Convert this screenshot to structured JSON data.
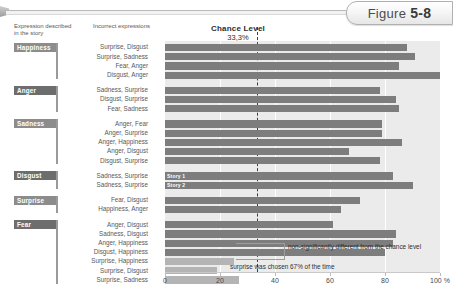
{
  "figure": {
    "label": "Figure",
    "number": "5",
    "dash": "-",
    "sub": "8"
  },
  "headers": {
    "expression_col": "Expression described in the story",
    "incorrect_col": "Incorrect expressions"
  },
  "annotations": {
    "non_significant": "non-significantly different from the chance level",
    "surprise_note": "surprise was chosen 67% of the time",
    "bar_label_story1": "Story 1",
    "bar_label_story2": "Story 2"
  },
  "chart_data": {
    "type": "bar",
    "title": "Chance Level",
    "subtitle": "33,3%",
    "xlabel": "",
    "ylabel": "",
    "xlim": [
      0,
      100
    ],
    "xticks": [
      0,
      20,
      40,
      60,
      80,
      100
    ],
    "xticklabels": [
      "0",
      "20",
      "40",
      "60",
      "80",
      "100 %"
    ],
    "unit": "%",
    "grid": true,
    "orientation": "horizontal",
    "chance_level": 33.3,
    "groups": [
      {
        "category": "Happiness",
        "bars": [
          {
            "label": "Surprise, Disgust",
            "value": 88,
            "shade": "dark"
          },
          {
            "label": "Surprise, Sadness",
            "value": 91,
            "shade": "dark"
          },
          {
            "label": "Fear, Anger",
            "value": 85,
            "shade": "dark"
          },
          {
            "label": "Disgust, Anger",
            "value": 100,
            "shade": "dark"
          }
        ]
      },
      {
        "category": "Anger",
        "bars": [
          {
            "label": "Sadness, Surprise",
            "value": 78,
            "shade": "dark"
          },
          {
            "label": "Disgust, Surprise",
            "value": 84,
            "shade": "dark"
          },
          {
            "label": "Fear, Sadness",
            "value": 85,
            "shade": "dark"
          }
        ]
      },
      {
        "category": "Sadness",
        "bars": [
          {
            "label": "Anger, Fear",
            "value": 79,
            "shade": "dark"
          },
          {
            "label": "Anger, Surprise",
            "value": 79,
            "shade": "dark"
          },
          {
            "label": "Anger, Happiness",
            "value": 86,
            "shade": "dark"
          },
          {
            "label": "Anger, Disgust",
            "value": 67,
            "shade": "dark"
          },
          {
            "label": "Disgust, Surprise",
            "value": 78,
            "shade": "dark"
          }
        ]
      },
      {
        "category": "Disgust",
        "bars": [
          {
            "label": "Sadness, Surprise",
            "value": 83,
            "shade": "dark",
            "overlay": "Story 1"
          },
          {
            "label": "Sadness, Surprise",
            "value": 90,
            "shade": "dark",
            "overlay": "Story 2"
          }
        ]
      },
      {
        "category": "Surprise",
        "bars": [
          {
            "label": "Fear, Disgust",
            "value": 71,
            "shade": "dark"
          },
          {
            "label": "Happiness, Anger",
            "value": 64,
            "shade": "dark"
          }
        ]
      },
      {
        "category": "Fear",
        "bars": [
          {
            "label": "Anger, Disgust",
            "value": 61,
            "shade": "dark"
          },
          {
            "label": "Sadness, Disgust",
            "value": 84,
            "shade": "dark"
          },
          {
            "label": "Anger, Happiness",
            "value": 83,
            "shade": "dark"
          },
          {
            "label": "Disgust, Happiness",
            "value": 80,
            "shade": "dark"
          },
          {
            "label": "Surprise, Happiness",
            "value": 25,
            "shade": "light"
          },
          {
            "label": "Surprise, Disgust",
            "value": 19,
            "shade": "light"
          },
          {
            "label": "Surprise, Sadness",
            "value": 27,
            "shade": "light"
          }
        ]
      }
    ]
  }
}
